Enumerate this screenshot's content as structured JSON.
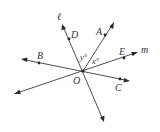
{
  "diagram": {
    "type": "geometry-lines-through-point",
    "colors": {
      "line": "#3a3a3a",
      "text": "#333333",
      "background": "#ffffff"
    },
    "center": {
      "label": "O",
      "x": 83,
      "y": 71
    },
    "lines": [
      {
        "name": "l",
        "label": "ℓ",
        "from": [
          62,
          24
        ],
        "to": [
          104,
          122
        ],
        "arrows": "both",
        "points": [
          "D"
        ]
      },
      {
        "name": "m",
        "label": "m",
        "from": [
          14,
          94
        ],
        "to": [
          138,
          52
        ],
        "arrows": "both",
        "points": [
          "E"
        ]
      },
      {
        "name": "BC",
        "label": "",
        "from": [
          21,
          59
        ],
        "to": [
          130,
          81
        ],
        "arrows": "both",
        "points": [
          "B",
          "C"
        ]
      }
    ],
    "rays": [
      {
        "name": "OA",
        "from": [
          83,
          71
        ],
        "to": [
          114,
          22
        ],
        "arrows": "end",
        "points": [
          "A"
        ]
      }
    ],
    "points": [
      {
        "label": "A",
        "x": 105,
        "y": 35
      },
      {
        "label": "B",
        "x": 39,
        "y": 63
      },
      {
        "label": "C",
        "x": 120,
        "y": 79
      },
      {
        "label": "D",
        "x": 69,
        "y": 39
      },
      {
        "label": "E",
        "x": 124,
        "y": 58
      },
      {
        "label": "O",
        "x": 83,
        "y": 71
      }
    ],
    "labels": {
      "l": "ℓ",
      "m": "m",
      "A": "A",
      "B": "B",
      "C": "C",
      "D": "D",
      "E": "E",
      "O": "O"
    },
    "angles": [
      {
        "label": "y°",
        "between": [
          "OD",
          "OA"
        ]
      },
      {
        "label": "x°",
        "between": [
          "OA",
          "OE"
        ]
      }
    ]
  }
}
